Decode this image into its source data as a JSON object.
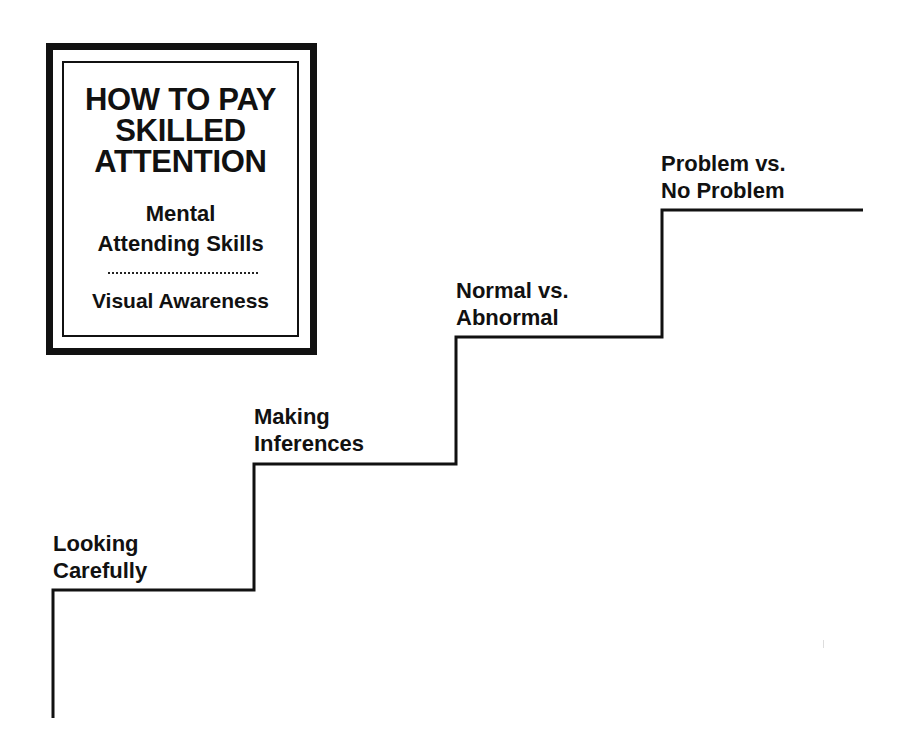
{
  "sign": {
    "title_lines": [
      "HOW TO PAY",
      "SKILLED",
      "ATTENTION"
    ],
    "subtitle_lines": [
      "Mental",
      "Attending Skills"
    ],
    "divider": "dotted",
    "footer": "Visual Awareness"
  },
  "staircase": {
    "steps": [
      {
        "lines": [
          "Looking",
          "Carefully"
        ]
      },
      {
        "lines": [
          "Making",
          "Inferences"
        ]
      },
      {
        "lines": [
          "Normal vs.",
          "Abnormal"
        ]
      },
      {
        "lines": [
          "Problem vs.",
          "No Problem"
        ]
      }
    ],
    "line_color": "#111111"
  }
}
